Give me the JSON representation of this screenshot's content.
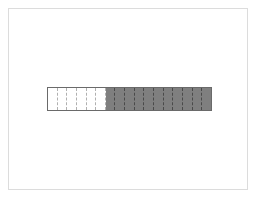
{
  "diagram": {
    "type": "fraction-bar",
    "total_parts": 17,
    "unshaded_parts": 6,
    "shaded_parts": 11,
    "colors": {
      "shaded": "#7f7f7f",
      "unshaded": "#ffffff",
      "outline": "#6a6a6a",
      "frame": "#dcdcdc"
    },
    "segments": [
      {
        "shaded": false
      },
      {
        "shaded": false
      },
      {
        "shaded": false
      },
      {
        "shaded": false
      },
      {
        "shaded": false
      },
      {
        "shaded": false
      },
      {
        "shaded": true
      },
      {
        "shaded": true
      },
      {
        "shaded": true
      },
      {
        "shaded": true
      },
      {
        "shaded": true
      },
      {
        "shaded": true
      },
      {
        "shaded": true
      },
      {
        "shaded": true
      },
      {
        "shaded": true
      },
      {
        "shaded": true
      },
      {
        "shaded": true
      }
    ]
  }
}
